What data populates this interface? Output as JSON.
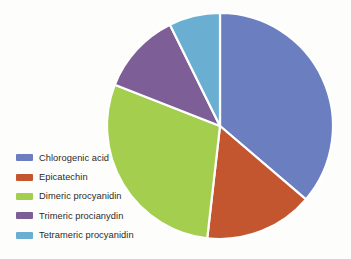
{
  "chart_data": {
    "type": "pie",
    "title": "",
    "subtitle": "",
    "xlabel": "",
    "ylabel": "",
    "legend_position": "left-bottom",
    "grid": false,
    "start_angle_deg": 0,
    "direction": "clockwise",
    "categories": [
      "Chlorogenic acid",
      "Epicatechin",
      "Dimeric procyanidin",
      "Trimeric procianydin",
      "Tetrameric procyanidin"
    ],
    "values": [
      36.3,
      15.6,
      29.1,
      11.7,
      7.3
    ],
    "colors": [
      "#6b7fc0",
      "#c4562f",
      "#a4ce4e",
      "#7e5e97",
      "#6aafd2"
    ],
    "slices": [
      {
        "label": "Chlorogenic acid",
        "value": 36.3,
        "color": "#6b7fc0",
        "start_angle_deg": 0,
        "end_angle_deg": 130.5
      },
      {
        "label": "Epicatechin",
        "value": 15.6,
        "color": "#c4562f",
        "start_angle_deg": 130.5,
        "end_angle_deg": 186.5
      },
      {
        "label": "Dimeric procyanidin",
        "value": 29.1,
        "color": "#a4ce4e",
        "start_angle_deg": 186.5,
        "end_angle_deg": 291.4
      },
      {
        "label": "Trimeric procianydin",
        "value": 11.7,
        "color": "#7e5e97",
        "start_angle_deg": 291.4,
        "end_angle_deg": 333.7
      },
      {
        "label": "Tetrameric procyanidin",
        "value": 7.3,
        "color": "#6aafd2",
        "start_angle_deg": 333.7,
        "end_angle_deg": 360
      }
    ],
    "geometry": {
      "center_x": 220,
      "center_y": 126,
      "radius": 113,
      "separator_color": "#ffffff",
      "separator_width": 2.2
    }
  },
  "legend": {
    "items": [
      {
        "label": "Chlorogenic acid",
        "color": "#6b7fc0"
      },
      {
        "label": "Epicatechin",
        "color": "#c4562f"
      },
      {
        "label": "Dimeric procyanidin",
        "color": "#a4ce4e"
      },
      {
        "label": "Trimeric procianydin",
        "color": "#7e5e97"
      },
      {
        "label": "Tetrameric procyanidin",
        "color": "#6aafd2"
      }
    ]
  }
}
